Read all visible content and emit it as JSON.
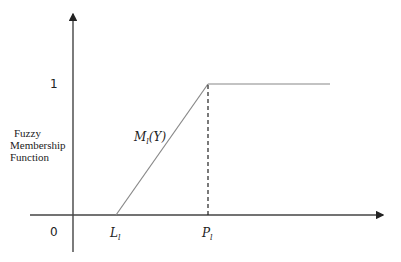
{
  "diagram": {
    "type": "trapezoidal-membership-function",
    "y_axis": {
      "label_lines": [
        "Fuzzy",
        "Membership",
        "Function"
      ],
      "tick_1": "1",
      "origin": "0"
    },
    "x_axis": {
      "ticks": [
        {
          "name": "L",
          "sub": "l"
        },
        {
          "name": "P",
          "sub": "l"
        }
      ]
    },
    "curve": {
      "label": "M",
      "label_sub": "l",
      "label_arg": "(Y)",
      "points": [
        [
          116,
          215
        ],
        [
          208,
          84
        ],
        [
          330,
          84
        ]
      ]
    },
    "colors": {
      "axis": "#333333",
      "curve": "#888888",
      "dashed": "#222222"
    }
  }
}
